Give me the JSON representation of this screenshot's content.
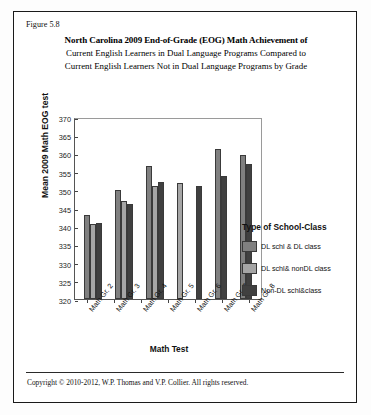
{
  "figure": {
    "label": "Figure 5.8",
    "title_line1": "North Carolina 2009 End-of-Grade (EOG) Math Achievement of",
    "title_line2": "Current English Learners in Dual Language Programs Compared to",
    "title_line3": "Current English Learners Not in Dual Language Programs by Grade",
    "copyright": "Copyright © 2010-2012, W.P. Thomas and V.P. Collier.  All rights reserved."
  },
  "legend": {
    "title": "Type of School-Class",
    "entries": [
      {
        "label": "DL schl & DL class",
        "color": "#808080"
      },
      {
        "label": "DL schl& nonDL class",
        "color": "#a6a6a6"
      },
      {
        "label": "Non-DL schl&class",
        "color": "#404040"
      }
    ]
  },
  "chart_data": {
    "type": "bar",
    "title": "North Carolina 2009 End-of-Grade (EOG) Math Achievement of Current English Learners in Dual Language Programs Compared to Current English Learners Not in Dual Language Programs by Grade",
    "xlabel": "Math Test",
    "ylabel": "Mean 2009 Math EOG test",
    "ylim": [
      320,
      370
    ],
    "yticks": [
      320,
      325,
      330,
      335,
      340,
      345,
      350,
      355,
      360,
      365,
      370
    ],
    "grid": false,
    "legend_position": "right",
    "categories": [
      "Math Gr. 2",
      "Math Gr. 3",
      "Math Gr. 4",
      "Math Gr. 5",
      "Math Gr. 6",
      "Math Gr. 7",
      "Math Gr. 8"
    ],
    "series": [
      {
        "name": "DL schl & DL class",
        "color": "#808080",
        "values": [
          343.0,
          350.0,
          356.5,
          null,
          null,
          361.3,
          359.5
        ]
      },
      {
        "name": "DL schl& nonDL class",
        "color": "#a6a6a6",
        "values": [
          340.5,
          347.0,
          351.0,
          352.0,
          null,
          null,
          null
        ]
      },
      {
        "name": "Non-DL schl&class",
        "color": "#404040",
        "values": [
          341.0,
          346.0,
          352.2,
          null,
          351.0,
          353.8,
          357.0
        ]
      }
    ]
  }
}
